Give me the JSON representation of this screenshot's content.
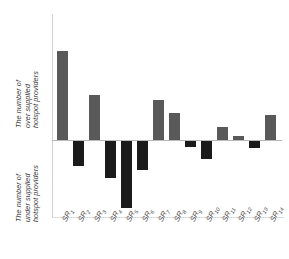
{
  "chart_data": {
    "type": "bar",
    "title": "",
    "subtitle": "",
    "xlabel": "",
    "ylabel_positive": "The number of over supplied hotspot providers",
    "ylabel_negative": "The number of under supplied hotspot providers",
    "categories": [
      "SR1",
      "SR2",
      "SR3",
      "SR4",
      "SR5",
      "SR6",
      "SR7",
      "SR8",
      "SR9",
      "SR10",
      "SR11",
      "SR12",
      "SR13",
      "SR14"
    ],
    "category_base": "SR",
    "category_subscripts": [
      "1",
      "2",
      "3",
      "4",
      "5",
      "6",
      "7",
      "8",
      "9",
      "10",
      "11",
      "12",
      "13",
      "14"
    ],
    "values": [
      25,
      -7,
      12.5,
      -10.5,
      -19,
      -8,
      11,
      7.5,
      -1.5,
      -5,
      3.5,
      1,
      -2,
      7
    ],
    "ylim": [
      -25,
      30
    ],
    "grid": false,
    "legend": null,
    "axis_ticks_shown": false,
    "positive_color": "#595959",
    "negative_color": "#1b1b1b",
    "axis_color": "#b9b9b9",
    "background_color": "#ffffff",
    "bars": [
      {
        "category": "SR1",
        "value": 25,
        "sign": "positive",
        "left": 4,
        "width": 11,
        "top": 37,
        "height": 89
      },
      {
        "category": "SR2",
        "value": -7,
        "sign": "negative",
        "left": 20,
        "width": 11,
        "top": 127,
        "height": 25
      },
      {
        "category": "SR3",
        "value": 12.5,
        "sign": "positive",
        "left": 36,
        "width": 11,
        "top": 81,
        "height": 45
      },
      {
        "category": "SR4",
        "value": -10.5,
        "sign": "negative",
        "left": 52,
        "width": 11,
        "top": 127,
        "height": 37
      },
      {
        "category": "SR5",
        "value": -19,
        "sign": "negative",
        "left": 68,
        "width": 11,
        "top": 127,
        "height": 67
      },
      {
        "category": "SR6",
        "value": -8,
        "sign": "negative",
        "left": 84,
        "width": 11,
        "top": 127,
        "height": 29
      },
      {
        "category": "SR7",
        "value": 11,
        "sign": "positive",
        "left": 100,
        "width": 11,
        "top": 86,
        "height": 40
      },
      {
        "category": "SR8",
        "value": 7.5,
        "sign": "positive",
        "left": 116,
        "width": 11,
        "top": 99,
        "height": 27
      },
      {
        "category": "SR9",
        "value": -1.5,
        "sign": "negative",
        "left": 132,
        "width": 11,
        "top": 127,
        "height": 6
      },
      {
        "category": "SR10",
        "value": -5,
        "sign": "negative",
        "left": 148,
        "width": 11,
        "top": 127,
        "height": 18
      },
      {
        "category": "SR11",
        "value": 3.5,
        "sign": "positive",
        "left": 164,
        "width": 11,
        "top": 113,
        "height": 13
      },
      {
        "category": "SR12",
        "value": 1,
        "sign": "positive",
        "left": 180,
        "width": 11,
        "top": 122,
        "height": 4
      },
      {
        "category": "SR13",
        "value": -2,
        "sign": "negative",
        "left": 196,
        "width": 11,
        "top": 127,
        "height": 7
      },
      {
        "category": "SR14",
        "value": 7,
        "sign": "positive",
        "left": 212,
        "width": 11,
        "top": 101,
        "height": 25
      }
    ]
  },
  "axis": {
    "ylabel_over_lines": [
      "The number of",
      "over supplied",
      "hotspot providers"
    ],
    "ylabel_under_lines": [
      "The number of",
      "under supplied",
      "hotspot providers"
    ]
  }
}
